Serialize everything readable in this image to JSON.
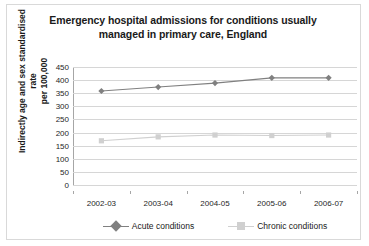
{
  "chart_data": {
    "type": "line",
    "title": "Emergency hospital admissions for conditions usually managed in primary care, England",
    "title_lines": [
      "Emergency hospital admissions for conditions usually",
      "managed in primary care, England"
    ],
    "xlabel": "",
    "ylabel": "Indirectly age and sex standardised rate per 100,000",
    "ylabel_lines": [
      "Indirectly age and sex standardised rate",
      "per 100,000"
    ],
    "categories": [
      "2002-03",
      "2003-04",
      "2004-05",
      "2005-06",
      "2006-07"
    ],
    "series": [
      {
        "name": "Acute conditions",
        "values": [
          370,
          385,
          400,
          420,
          420
        ],
        "color": "#808080",
        "marker": "diamond"
      },
      {
        "name": "Chronic conditions",
        "values": [
          180,
          195,
          202,
          200,
          202
        ],
        "color": "#d0d0d0",
        "marker": "square"
      }
    ],
    "ylim": [
      0,
      450
    ],
    "yticks": [
      0,
      50,
      100,
      150,
      200,
      250,
      300,
      350,
      400,
      450
    ],
    "ytick_labels": [
      "0",
      "50",
      "100",
      "150",
      "200",
      "250",
      "300",
      "350",
      "400",
      "450"
    ],
    "grid": true,
    "legend_position": "bottom"
  }
}
